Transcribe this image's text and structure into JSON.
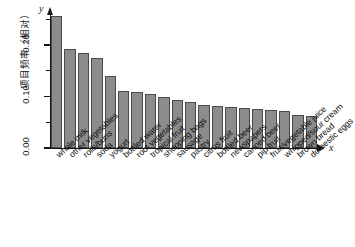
{
  "chart_data": {
    "type": "bar",
    "title": "",
    "xlabel": "x",
    "ylabel": "项目频率（相对）",
    "ylim": [
      0.0,
      0.26
    ],
    "grid": false,
    "legend": null,
    "y_tick_labels": [
      "0.00",
      "0.10",
      "0.20"
    ],
    "y_tick_values": [
      0.0,
      0.1,
      0.2
    ],
    "y_minor_tick_values": [
      0.05,
      0.15,
      0.25
    ],
    "axis_symbols": {
      "x": "x",
      "y": "y"
    },
    "bar_color": "#8c8c8c",
    "bar_edge_color": "#4a4a4a",
    "categories": [
      "whole milk",
      "other vegetables",
      "rolls/buns",
      "soda",
      "yogurt",
      "bottled water",
      "root vegetables",
      "tropical fruit",
      "shopping bags",
      "sausage",
      "pastry",
      "citrus fruit",
      "bottled beer",
      "newspapers",
      "canned beer",
      "pip fruit",
      "fruit/vegetable juice",
      "whipped/sour cream",
      "brown bread",
      "domestic eggs"
    ],
    "values": [
      0.256,
      0.193,
      0.184,
      0.174,
      0.14,
      0.111,
      0.109,
      0.105,
      0.099,
      0.094,
      0.089,
      0.083,
      0.081,
      0.08,
      0.078,
      0.076,
      0.073,
      0.072,
      0.065,
      0.063
    ]
  }
}
